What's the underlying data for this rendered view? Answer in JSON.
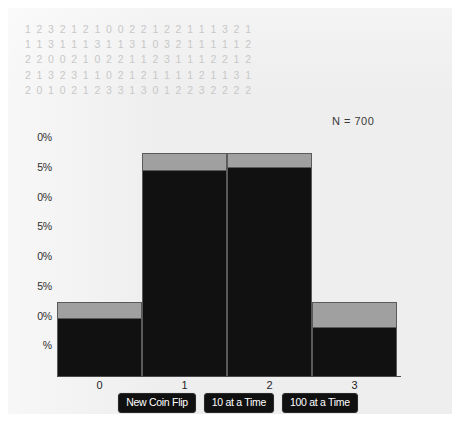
{
  "sample_label": "N = 700",
  "data_rows": [
    "1 2 3 2 1 2 1 0 0 2 2 1 2 2 1 1 1 3 2 1",
    "1 1 3 1 1 1 3 1 1 3 1 0 3 2 1 1 1 1 1 2",
    "2 2 0 0 2 1 0 2 2 1 1 2 3 1 1 1 2 2 1 2",
    "2 1 3 2 3 1 1 0 2 1 2 1 1 1 1 2 1 1 3 1",
    "2 0 1 0 2 1 2 3 3 1 3 0 1 2 2 3 2 2 2 2"
  ],
  "buttons": [
    {
      "label": "New Coin Flip",
      "name": "new-coin-flip-button"
    },
    {
      "label": "10 at a Time",
      "name": "ten-at-a-time-button"
    },
    {
      "label": "100 at a Time",
      "name": "hundred-at-a-time-button"
    }
  ],
  "colors": {
    "observed_bar": "#111111",
    "expected_bar": "#a0a0a0",
    "panel_background": "#eeeeee",
    "data_text": "#c8c8c8",
    "button_background": "#101010"
  },
  "chart_data": {
    "type": "bar",
    "title": "",
    "xlabel": "",
    "ylabel": "",
    "categories": [
      "0",
      "1",
      "2",
      "3"
    ],
    "ylim": [
      0,
      40
    ],
    "ytick_labels": [
      "0%",
      "5%",
      "10%",
      "15%",
      "20%",
      "25%",
      "30%",
      "35%",
      "40%"
    ],
    "ytick_values": [
      0,
      5,
      10,
      15,
      20,
      25,
      30,
      35,
      40
    ],
    "ytick_labels_clipped": [
      "%",
      "%",
      "0%",
      "5%",
      "0%",
      "5%",
      "0%",
      "5%",
      "0%"
    ],
    "grid": false,
    "legend": "none",
    "annotations": [
      "N = 700"
    ],
    "series": [
      {
        "name": "Observed",
        "color": "#111111",
        "values": [
          9.5,
          34.5,
          35.0,
          8.0
        ]
      },
      {
        "name": "Expected",
        "color": "#a0a0a0",
        "values": [
          12.5,
          37.5,
          37.5,
          12.5
        ]
      }
    ]
  }
}
